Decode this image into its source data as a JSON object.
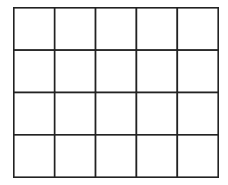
{
  "grid": {
    "rows": 4,
    "columns": 5,
    "line_color": "#222222",
    "background_color": "#ffffff"
  }
}
